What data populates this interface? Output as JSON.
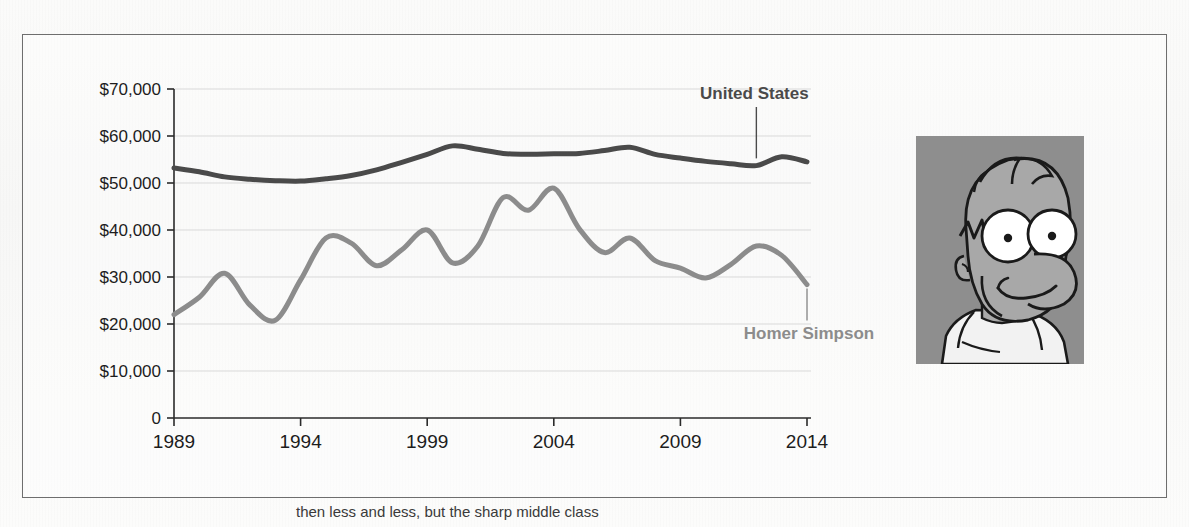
{
  "figure": {
    "caption": "then less and less, but the sharp middle class",
    "photo": {
      "name": "homer-simpson-portrait",
      "alt_subject": "Homer Simpson",
      "background_color": "#8e8e8e",
      "skin_color": "#a8a8a8",
      "shirt_color": "#f2f2f2",
      "outline_color": "#1a1a1a"
    }
  },
  "chart_data": {
    "type": "line",
    "title": "",
    "subtitle": "",
    "xlabel": "",
    "ylabel": "",
    "grid": true,
    "legend_position": "inline-annotations",
    "x": [
      1989,
      1990,
      1991,
      1992,
      1993,
      1994,
      1995,
      1996,
      1997,
      1998,
      1999,
      2000,
      2001,
      2002,
      2003,
      2004,
      2005,
      2006,
      2007,
      2008,
      2009,
      2010,
      2011,
      2012,
      2013,
      2014
    ],
    "xlim": [
      1989,
      2014
    ],
    "ylim": [
      0,
      70000
    ],
    "xticks": [
      "1989",
      "1994",
      "1999",
      "2004",
      "2009",
      "2014"
    ],
    "xtick_values": [
      1989,
      1994,
      1999,
      2004,
      2009,
      2014
    ],
    "yticks": [
      "0",
      "$10,000",
      "$20,000",
      "$30,000",
      "$40,000",
      "$50,000",
      "$60,000",
      "$70,000"
    ],
    "ytick_values": [
      0,
      10000,
      20000,
      30000,
      40000,
      50000,
      60000,
      70000
    ],
    "ytick_step": 10000,
    "series": [
      {
        "name": "United States",
        "label": "United States",
        "color": "#4a4a4a",
        "line_width": 5,
        "annotation": {
          "text": "United States",
          "x": 2012,
          "y": 54600,
          "leader_line": true
        },
        "values": [
          53200,
          52400,
          51300,
          50800,
          50500,
          50400,
          50900,
          51600,
          52800,
          54400,
          56100,
          57900,
          57200,
          56300,
          56100,
          56200,
          56300,
          56900,
          57600,
          56100,
          55300,
          54600,
          54100,
          53700,
          55600,
          54500
        ]
      },
      {
        "name": "Homer Simpson",
        "label": "Homer Simpson",
        "color": "#8c8c8c",
        "line_width": 5,
        "annotation": {
          "text": "Homer Simpson",
          "x": 2014,
          "y": 28400,
          "leader_line": true
        },
        "values": [
          22000,
          25700,
          30800,
          24000,
          20800,
          29400,
          38300,
          37200,
          32400,
          35800,
          40000,
          33000,
          36600,
          46900,
          44200,
          48900,
          40300,
          35200,
          38300,
          33500,
          31900,
          29800,
          32700,
          36600,
          34600,
          28400
        ]
      }
    ],
    "series_secondary_x_note": "Homer Simpson series spans 1989-2012 at one point per year plus end-of-range points"
  },
  "annotations": {
    "united_states": "United States",
    "homer_simpson": "Homer Simpson"
  },
  "colors": {
    "frame_border": "#6e6e6e",
    "gridline": "#d9d9d9",
    "axis": "#2b2b2b",
    "tick_label": "#1d1d1d",
    "us_line": "#4a4a4a",
    "homer_line": "#8c8c8c",
    "page_background": "#f9f9f8"
  }
}
